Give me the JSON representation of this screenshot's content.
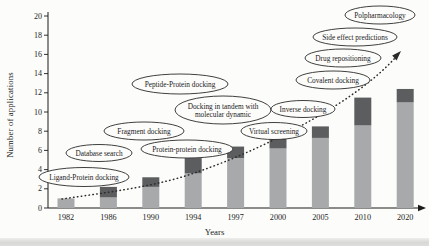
{
  "figure": {
    "background": "#fcfcfa",
    "bottom_band_color": "#d8d8d6"
  },
  "chart_data": {
    "type": "bar",
    "stacked": true,
    "title": "",
    "xlabel": "Years",
    "ylabel": "Number of applications",
    "ylim": [
      0,
      20
    ],
    "ytick_step": 2,
    "grid": false,
    "legend": "none",
    "categories": [
      "1982",
      "1986",
      "1990",
      "1994",
      "1997",
      "2000",
      "2005",
      "2010",
      "2020"
    ],
    "series": [
      {
        "name": "lower-segment",
        "color": "#a7a9ab",
        "values": [
          1.0,
          1.1,
          2.2,
          3.6,
          5.2,
          6.2,
          7.3,
          8.6,
          11.0
        ]
      },
      {
        "name": "upper-segment",
        "color": "#5b5d5f",
        "values": [
          0,
          1.1,
          1.0,
          1.6,
          1.2,
          1.0,
          1.2,
          2.9,
          1.4
        ]
      }
    ],
    "totals": [
      1.0,
      2.2,
      3.2,
      5.2,
      6.4,
      7.2,
      8.5,
      11.5,
      12.4
    ],
    "trend": {
      "style": "dotted",
      "direction": "ascending",
      "arrow": true,
      "color": "#2b2b2b"
    },
    "axis_color": "#1b1b1b",
    "annotation_stroke": "#2a2a2a",
    "annotation_fill": "#fcfcfa",
    "annotations": [
      {
        "label": "Ligand-Protein docking",
        "lines": [
          "Ligand-Protein docking"
        ],
        "cx": 84,
        "cy": 177,
        "rx": 45,
        "ry": 9.5
      },
      {
        "label": "Database search",
        "lines": [
          "Database search"
        ],
        "cx": 99,
        "cy": 153,
        "rx": 33,
        "ry": 8.5
      },
      {
        "label": "Fragment docking",
        "lines": [
          "Fragment docking"
        ],
        "cx": 144,
        "cy": 131,
        "rx": 40,
        "ry": 9
      },
      {
        "label": "Protein-protein docking",
        "lines": [
          "Protein-protein docking"
        ],
        "cx": 187,
        "cy": 149,
        "rx": 46,
        "ry": 9
      },
      {
        "label": "Peptide-Protein docking",
        "lines": [
          "Peptide-Protein docking"
        ],
        "cx": 180,
        "cy": 84,
        "rx": 48,
        "ry": 10
      },
      {
        "label": "Docking in tandem with molecular dynamic",
        "lines": [
          "Docking in tandem with",
          "molecular dynamic"
        ],
        "cx": 223,
        "cy": 110,
        "rx": 48,
        "ry": 14
      },
      {
        "label": "Virtual screening",
        "lines": [
          "Virtual screening"
        ],
        "cx": 274,
        "cy": 131,
        "rx": 33,
        "ry": 8.5
      },
      {
        "label": "Inverse docking",
        "lines": [
          "Inverse docking"
        ],
        "cx": 303,
        "cy": 109,
        "rx": 32,
        "ry": 8.5
      },
      {
        "label": "Covalent docking",
        "lines": [
          "Covalent docking"
        ],
        "cx": 333,
        "cy": 80,
        "rx": 37,
        "ry": 9
      },
      {
        "label": "Drug repositioning",
        "lines": [
          "Drug repositioning"
        ],
        "cx": 343,
        "cy": 58,
        "rx": 38,
        "ry": 9
      },
      {
        "label": "Side effect predictions",
        "lines": [
          "Side effect predictions"
        ],
        "cx": 355,
        "cy": 37,
        "rx": 42,
        "ry": 9
      },
      {
        "label": "Polpharmacology",
        "lines": [
          "Polpharmacology"
        ],
        "cx": 380,
        "cy": 15,
        "rx": 35,
        "ry": 9
      }
    ],
    "layout": {
      "x_axis_y": 208,
      "y_axis_x": 48,
      "y_axis_top": 12,
      "unit_px": 9.6,
      "bar_start_x": 66,
      "bar_step": 42.4,
      "bar_width": 17,
      "x_axis_end": 420
    }
  }
}
